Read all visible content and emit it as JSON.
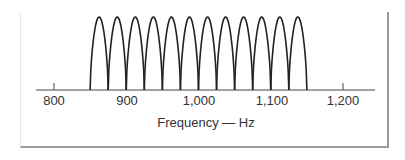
{
  "chart_data": {
    "type": "line",
    "title": "",
    "xlabel": "Frequency — Hz",
    "ylabel": "",
    "xlim": [
      770,
      1240
    ],
    "x_ticks": [
      800,
      900,
      1000,
      1100,
      1200
    ],
    "x_tick_labels": [
      "800",
      "900",
      "1,000",
      "1,100",
      "1,200"
    ],
    "grid": false,
    "legend": null,
    "series": [
      {
        "name": "lobes",
        "lobe_width_hz": 25,
        "lobe_height": 1,
        "lobe_starts_hz": [
          850,
          875,
          900,
          925,
          950,
          975,
          1000,
          1025,
          1050,
          1075,
          1100,
          1125
        ]
      }
    ]
  },
  "axis": {
    "tick_labels": [
      "800",
      "900",
      "1,000",
      "1,100",
      "1,200"
    ],
    "label": "Frequency — Hz"
  },
  "colors": {
    "line": "#222222",
    "axis": "#444444",
    "frame": "#9a9a9a"
  }
}
